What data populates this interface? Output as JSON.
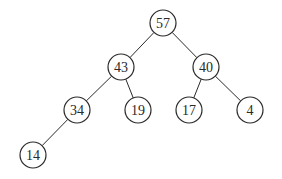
{
  "diagram": {
    "type": "binary-tree",
    "radius": 13,
    "colors": {
      "stroke": "#2a2a2a",
      "fill": "#ffffff",
      "background": "#ffffff"
    },
    "nodes": [
      {
        "id": "n57",
        "label": "57",
        "x": 163,
        "y": 23
      },
      {
        "id": "n43",
        "label": "43",
        "x": 121,
        "y": 67
      },
      {
        "id": "n40",
        "label": "40",
        "x": 206,
        "y": 67
      },
      {
        "id": "n34",
        "label": "34",
        "x": 77,
        "y": 110
      },
      {
        "id": "n19",
        "label": "19",
        "x": 138,
        "y": 110
      },
      {
        "id": "n17",
        "label": "17",
        "x": 189,
        "y": 110
      },
      {
        "id": "n4",
        "label": "4",
        "x": 250,
        "y": 110
      },
      {
        "id": "n14",
        "label": "14",
        "x": 33,
        "y": 155
      }
    ],
    "edges": [
      {
        "from": "n57",
        "to": "n43"
      },
      {
        "from": "n57",
        "to": "n40"
      },
      {
        "from": "n43",
        "to": "n34"
      },
      {
        "from": "n43",
        "to": "n19"
      },
      {
        "from": "n40",
        "to": "n17"
      },
      {
        "from": "n40",
        "to": "n4"
      },
      {
        "from": "n34",
        "to": "n14"
      }
    ]
  }
}
